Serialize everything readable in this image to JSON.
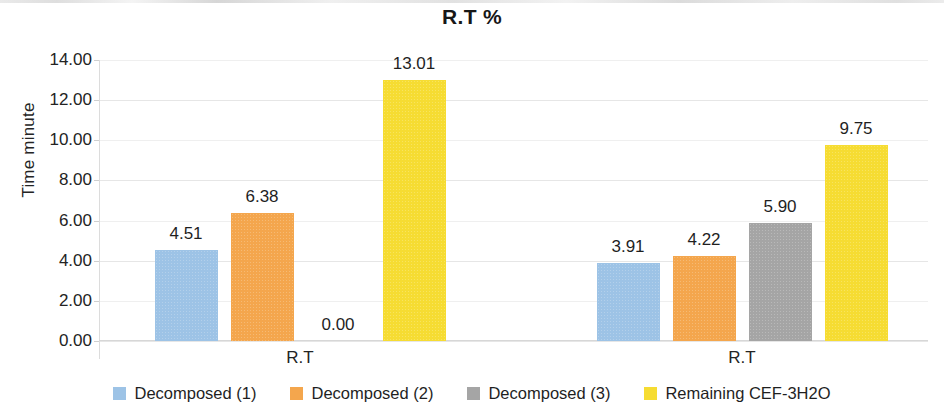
{
  "chart_data": {
    "type": "bar",
    "title": "R.T %",
    "xlabel": "",
    "ylabel": "Time minute",
    "categories": [
      "R.T",
      "R.T"
    ],
    "series": [
      {
        "name": "Decomposed (1)",
        "color": "#9DC3E6",
        "values": [
          4.51,
          3.91
        ]
      },
      {
        "name": "Decomposed (2)",
        "color": "#F4A64D",
        "values": [
          6.38,
          4.22
        ]
      },
      {
        "name": "Decomposed (3)",
        "color": "#A5A5A5",
        "values": [
          0.0,
          5.9
        ]
      },
      {
        "name": "Remaining CEF-3H2O",
        "color": "#F6DC32",
        "values": [
          13.01,
          9.75
        ]
      }
    ],
    "value_labels": [
      [
        "4.51",
        "6.38",
        "0.00",
        "13.01"
      ],
      [
        "3.91",
        "4.22",
        "5.90",
        "9.75"
      ]
    ],
    "ylim": [
      0,
      14
    ],
    "ytick_values": [
      0,
      2,
      4,
      6,
      8,
      10,
      12,
      14
    ],
    "ytick_labels": [
      "0.00",
      "2.00",
      "4.00",
      "6.00",
      "8.00",
      "10.00",
      "12.00",
      "14.00"
    ],
    "grid": true,
    "legend_position": "bottom"
  },
  "legend": {
    "items": [
      {
        "label": "Decomposed (1)",
        "color": "#9DC3E6"
      },
      {
        "label": "Decomposed (2)",
        "color": "#F4A64D"
      },
      {
        "label": "Decomposed (3)",
        "color": "#A5A5A5"
      },
      {
        "label": "Remaining CEF-3H2O",
        "color": "#F6DC32"
      }
    ]
  }
}
